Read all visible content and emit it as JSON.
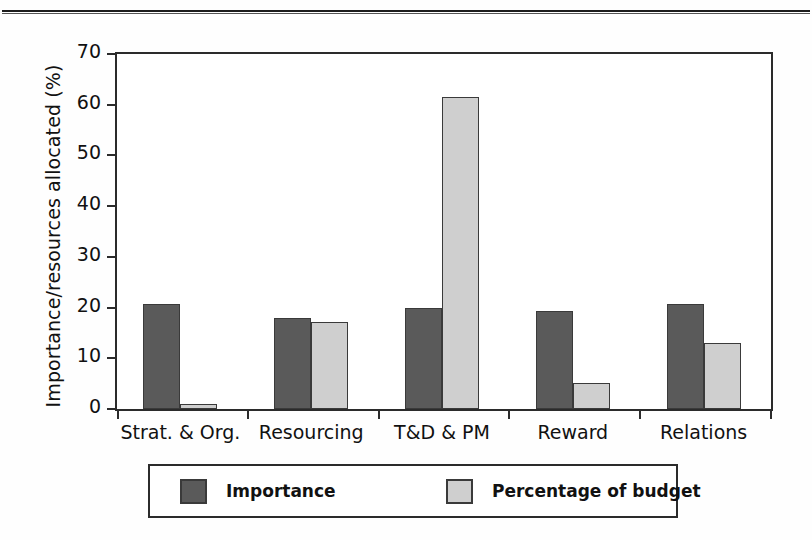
{
  "chart_data": {
    "type": "bar",
    "title": "",
    "xlabel": "",
    "ylabel": "Importance/resources allocated (%)",
    "ylim": [
      0,
      70
    ],
    "ytick_step": 10,
    "yticks": [
      0,
      10,
      20,
      30,
      40,
      50,
      60,
      70
    ],
    "grid": false,
    "legend_position": "bottom",
    "categories": [
      "Strat. & Org.",
      "Resourcing",
      "T&D & PM",
      "Reward",
      "Relations"
    ],
    "series": [
      {
        "name": "Importance",
        "color": "#5a5a5a",
        "values": [
          20.8,
          18.0,
          20.0,
          19.3,
          20.7
        ]
      },
      {
        "name": "Percentage of budget",
        "color": "#cfcfcf",
        "values": [
          1.0,
          17.1,
          61.6,
          5.2,
          13.1
        ]
      }
    ]
  },
  "axis": {
    "y_label": "Importance/resources allocated (%)",
    "y_tick_labels": [
      "70",
      "60",
      "50",
      "40",
      "30",
      "20",
      "10",
      "0"
    ]
  },
  "legend": {
    "items": [
      {
        "label": "Importance",
        "swatch": "dark-gray-swatch"
      },
      {
        "label": "Percentage of budget",
        "swatch": "light-gray-swatch"
      }
    ]
  }
}
